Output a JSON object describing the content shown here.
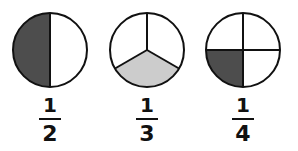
{
  "diagram": {
    "type": "fraction-circles",
    "colors": {
      "outline": "#111111",
      "dark_fill": "#4d4d4d",
      "light_fill": "#cccccc",
      "background": "#ffffff"
    },
    "items": [
      {
        "numerator": "1",
        "denominator": "2",
        "parts": 2,
        "shaded_parts": 1,
        "shade": "dark"
      },
      {
        "numerator": "1",
        "denominator": "3",
        "parts": 3,
        "shaded_parts": 1,
        "shade": "light"
      },
      {
        "numerator": "1",
        "denominator": "4",
        "parts": 4,
        "shaded_parts": 1,
        "shade": "dark"
      }
    ]
  }
}
